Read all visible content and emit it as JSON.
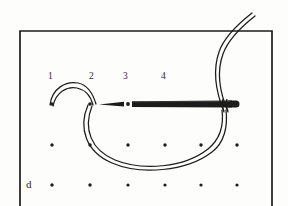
{
  "figure": {
    "label": "d",
    "label_pos": {
      "x": 26,
      "y": 180
    },
    "background_color": "#fdfdfc",
    "ink_color": "#1c1c1c",
    "frame": {
      "name": "fabric-frame",
      "left": 20,
      "top": 31,
      "right": 272,
      "open_bottom": true,
      "stroke_width": 1.6
    },
    "stitch_numbers": [
      {
        "label": "1",
        "x": 50,
        "y": 76
      },
      {
        "label": "2",
        "x": 91,
        "y": 76
      },
      {
        "label": "3",
        "x": 125,
        "y": 76
      },
      {
        "label": "4",
        "x": 163,
        "y": 76
      }
    ],
    "dot_grid": {
      "name": "fabric-dot-grid",
      "columns_x": [
        52,
        90,
        128,
        165,
        200,
        236
      ],
      "rows_y": [
        104,
        145,
        185
      ],
      "radius": 1.7,
      "top_row_visible_columns": [
        0,
        1,
        2
      ],
      "dot_count": 15
    },
    "needle": {
      "name": "sewing-needle",
      "tip_x": 100,
      "eye_x": 235,
      "shaft_y": 104,
      "shaft_thickness": 5,
      "point_length": 26
    },
    "thread": {
      "name": "embroidery-thread",
      "stroke_width": 1.3,
      "double_line_gap": 2.4,
      "segments": [
        {
          "name": "upper-arc-1-to-2",
          "from_dot": 1,
          "to_dot": 2
        },
        {
          "name": "lower-loop",
          "from_dot": 2,
          "to": "needle-eye"
        },
        {
          "name": "tail-above-frame",
          "from": "needle-eye",
          "to": "top-edge-exit"
        }
      ]
    }
  }
}
